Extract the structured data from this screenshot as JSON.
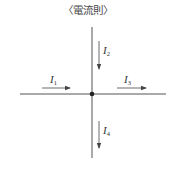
{
  "title": "〈電流則〉",
  "diagram": {
    "junction": {
      "x": 92,
      "y": 94
    },
    "wires": [
      {
        "id": "vertical",
        "x1": 92,
        "y1": 27,
        "x2": 92,
        "y2": 158
      },
      {
        "id": "horizontal",
        "x1": 20,
        "y1": 94,
        "x2": 166,
        "y2": 94
      }
    ],
    "currents": [
      {
        "name": "I",
        "sub": "1",
        "direction": "right",
        "x1": 42,
        "y1": 88,
        "x2": 70,
        "y2": 88,
        "label_x": 50,
        "label_y": 74
      },
      {
        "name": "I",
        "sub": "2",
        "direction": "down",
        "x1": 99,
        "y1": 41,
        "x2": 99,
        "y2": 69,
        "label_x": 103,
        "label_y": 46
      },
      {
        "name": "I",
        "sub": "3",
        "direction": "right",
        "x1": 117,
        "y1": 88,
        "x2": 146,
        "y2": 88,
        "label_x": 124,
        "label_y": 74
      },
      {
        "name": "I",
        "sub": "4",
        "direction": "down",
        "x1": 99,
        "y1": 121,
        "x2": 99,
        "y2": 148,
        "label_x": 103,
        "label_y": 126
      }
    ],
    "colors": {
      "wire": "#555555",
      "arrow": "#444444",
      "dot": "#222222"
    }
  }
}
